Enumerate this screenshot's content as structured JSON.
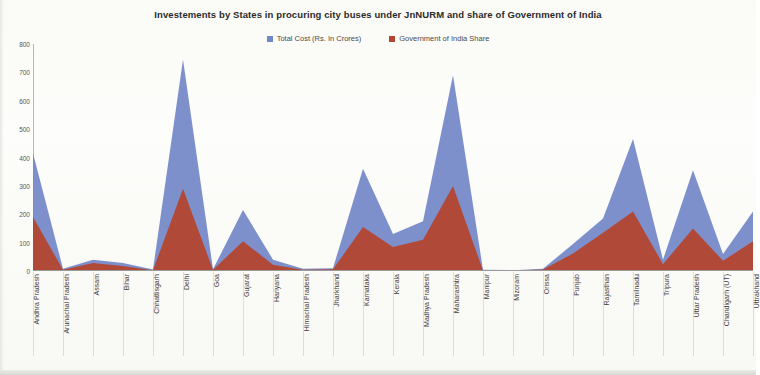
{
  "chart_data": {
    "type": "area",
    "title": "Investements by States in procuring city buses under JnNURM and share of Government of India",
    "xlabel": "",
    "ylabel": "",
    "ylim": [
      0,
      800
    ],
    "yticks": [
      0,
      100,
      200,
      300,
      400,
      500,
      600,
      700,
      800
    ],
    "grid": false,
    "legend_position": "top-center",
    "stacked": false,
    "categories": [
      "Andhra Pradesh",
      "Arunachal Pradesh",
      "Assam",
      "Bihar",
      "Chhattisgarh",
      "Delhi",
      "Goa",
      "Gujarat",
      "Hariyana",
      "Himachal Pradesh",
      "Jharkhand",
      "Karnataka",
      "Kerala",
      "Madhya Pradesh",
      "Maharashtra",
      "Manipur",
      "Mizoram",
      "Orissa",
      "Punjab",
      "Rajasthan",
      "Tamilnadu",
      "Tripura",
      "Uttar Pradesh",
      "Chandigarh (UT)",
      "Uttrakhand"
    ],
    "series": [
      {
        "name": "Total Cost (Rs. In Crores)",
        "color": "#7287c8",
        "values": [
          415,
          8,
          40,
          28,
          5,
          745,
          6,
          215,
          40,
          8,
          10,
          360,
          130,
          175,
          690,
          4,
          3,
          8,
          95,
          185,
          465,
          40,
          355,
          60,
          210
        ]
      },
      {
        "name": "Government of India Share",
        "color": "#b4462f",
        "values": [
          190,
          4,
          28,
          18,
          3,
          290,
          4,
          105,
          22,
          4,
          6,
          155,
          85,
          110,
          300,
          2,
          2,
          5,
          62,
          135,
          210,
          24,
          150,
          36,
          105
        ]
      }
    ]
  },
  "legend": {
    "items": [
      {
        "label": "Total Cost (Rs. In Crores)",
        "color": "#7287c8",
        "icon": "square-swatch-icon"
      },
      {
        "label": "Government of India Share",
        "color": "#b4462f",
        "icon": "square-swatch-icon"
      }
    ]
  },
  "axes": {
    "y_tick_labels": [
      "800",
      "700",
      "600",
      "500",
      "400",
      "300",
      "200",
      "100",
      "0"
    ]
  }
}
